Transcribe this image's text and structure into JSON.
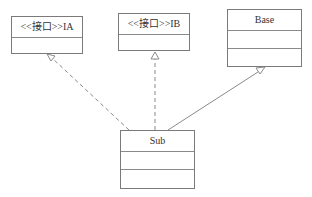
{
  "diagram": {
    "type": "uml-class-diagram",
    "classes": [
      {
        "id": "IA",
        "name": "<<接口>>IA",
        "stereotype": "接口",
        "kind": "interface"
      },
      {
        "id": "IB",
        "name": "<<接口>>IB",
        "stereotype": "接口",
        "kind": "interface"
      },
      {
        "id": "Base",
        "name": "Base",
        "kind": "class"
      },
      {
        "id": "Sub",
        "name": "Sub",
        "kind": "class"
      }
    ],
    "relations": [
      {
        "from": "Sub",
        "to": "IA",
        "type": "realization",
        "line": "dashed",
        "arrow": "hollow-triangle"
      },
      {
        "from": "Sub",
        "to": "IB",
        "type": "realization",
        "line": "dashed",
        "arrow": "hollow-triangle"
      },
      {
        "from": "Sub",
        "to": "Base",
        "type": "generalization",
        "line": "solid",
        "arrow": "hollow-triangle"
      }
    ],
    "colors": {
      "line": "#7a7a7a",
      "background": "#ffffff",
      "text": "#333333"
    }
  }
}
